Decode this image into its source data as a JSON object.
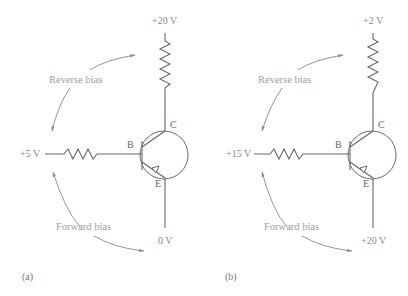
{
  "figure": {
    "panels": [
      {
        "id": "a",
        "caption": "(a)",
        "transistor_type": "PNP",
        "collector_supply": "+20 V",
        "base_supply": "+5 V",
        "emitter_supply": "0 V",
        "pins": {
          "base": "B",
          "collector": "C",
          "emitter": "E"
        },
        "annotations": {
          "reverse": "Reverse bias",
          "forward": "Forward bias"
        }
      },
      {
        "id": "b",
        "caption": "(b)",
        "transistor_type": "PNP",
        "collector_supply": "+2 V",
        "base_supply": "+15 V",
        "emitter_supply": "+20 V",
        "pins": {
          "base": "B",
          "collector": "C",
          "emitter": "E"
        },
        "annotations": {
          "reverse": "Reverse bias",
          "forward": "Forward bias"
        }
      }
    ]
  }
}
